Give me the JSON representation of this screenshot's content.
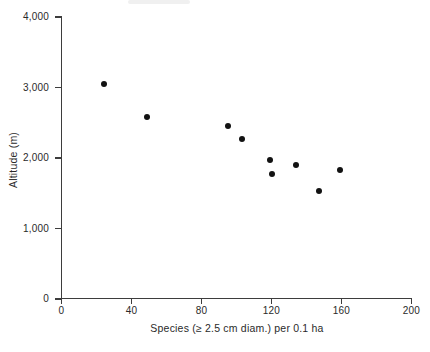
{
  "figure": {
    "background": "#ffffff"
  },
  "colors": {
    "axis": "#3d3d3d",
    "text": "#2a2a2a",
    "point": "#121212",
    "background": "#ffffff"
  },
  "chart_data": {
    "type": "scatter",
    "title": "",
    "xlabel": "Species (≥ 2.5 cm diam.) per 0.1 ha",
    "ylabel": "Altitude (m)",
    "xlim": [
      0,
      200
    ],
    "ylim": [
      0,
      4000
    ],
    "x_ticks": [
      0,
      40,
      80,
      120,
      160,
      200
    ],
    "x_tick_labels": [
      "0",
      "40",
      "80",
      "120",
      "160",
      "200"
    ],
    "y_ticks": [
      0,
      1000,
      2000,
      3000,
      4000
    ],
    "y_tick_labels": [
      "0",
      "1,000",
      "2,000",
      "3,000",
      "4,000"
    ],
    "grid": false,
    "marker": "filled-circle",
    "points": [
      {
        "x": 24,
        "y": 3050
      },
      {
        "x": 49,
        "y": 2575
      },
      {
        "x": 95,
        "y": 2450
      },
      {
        "x": 103,
        "y": 2275
      },
      {
        "x": 119,
        "y": 1965
      },
      {
        "x": 120,
        "y": 1775
      },
      {
        "x": 134,
        "y": 1900
      },
      {
        "x": 147,
        "y": 1525
      },
      {
        "x": 159,
        "y": 1830
      }
    ]
  }
}
